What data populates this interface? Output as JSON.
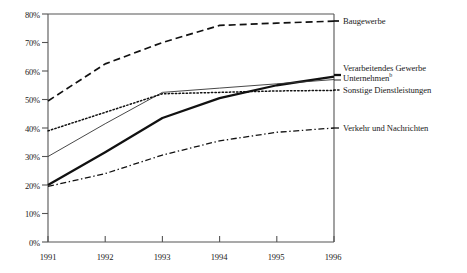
{
  "chart_data": {
    "type": "line",
    "title": "",
    "subtitle": "",
    "xlabel": "",
    "ylabel": "",
    "x": [
      "1991",
      "1992",
      "1993",
      "1994",
      "1995",
      "1996"
    ],
    "categories": [
      "1991",
      "1992",
      "1993",
      "1994",
      "1995",
      "1996"
    ],
    "xlim": [
      1991,
      1996
    ],
    "ylim": [
      0,
      80
    ],
    "ytick_labels": [
      "0%",
      "10%",
      "20%",
      "30%",
      "40%",
      "50%",
      "60%",
      "70%",
      "80%"
    ],
    "ytick_values": [
      0,
      10,
      20,
      30,
      40,
      50,
      60,
      70,
      80
    ],
    "xtick_labels": [
      "1991",
      "1992",
      "1993",
      "1994",
      "1995",
      "1996"
    ],
    "grid": false,
    "legend_position": "right-inline",
    "series": [
      {
        "name": "Baugewerbe",
        "style": "dashed",
        "values": [
          49.5,
          62.5,
          70.0,
          76.0,
          76.8,
          77.5
        ],
        "label_y_pct": 77.5
      },
      {
        "name": "Verarbeitendes Gewerbe Unternehmen",
        "style": "solid-thick",
        "values": [
          20.0,
          31.5,
          43.5,
          50.5,
          55.0,
          58.0
        ],
        "label_y_pct": 58.0
      },
      {
        "name": "Unternehmen",
        "style": "solid-thin",
        "values": [
          30.0,
          41.5,
          52.5,
          54.0,
          55.5,
          57.0
        ],
        "label_y_pct": 57.0
      },
      {
        "name": "Sonstige Dienstleistungen",
        "style": "dotted",
        "values": [
          39.0,
          45.5,
          52.0,
          52.5,
          53.0,
          53.2
        ],
        "label_y_pct": 53.2
      },
      {
        "name": "Verkehr und Nachrichten",
        "style": "dash-dot",
        "values": [
          19.5,
          24.0,
          30.5,
          35.5,
          38.5,
          40.0
        ],
        "label_y_pct": 40.0
      }
    ],
    "legend_entries": [
      {
        "label": "Baugewerbe",
        "style": "dashed"
      },
      {
        "label": "Verarbeitendes Gewerbe",
        "style": "solid-thick"
      },
      {
        "label": "Unternehmen",
        "footnote": "b",
        "style": "solid-thin"
      },
      {
        "label": "Sonstige Dienstleistungen",
        "style": "dotted"
      },
      {
        "label": "Verkehr und Nachrichten",
        "style": "dash-dot"
      }
    ],
    "colors": {
      "line": "#1a1a1a",
      "axis": "#555555",
      "background": "#ffffff"
    }
  },
  "labels": {
    "baugewerbe": "Baugewerbe",
    "verarbeitendes_gewerbe": "Verarbeitendes Gewerbe",
    "unternehmen": "Unternehmen",
    "unternehmen_footnote": "b",
    "sonstige_dienstleistungen": "Sonstige Dienstleistungen",
    "verkehr_und_nachrichten": "Verkehr und Nachrichten"
  },
  "yticks": {
    "t0": "0%",
    "t1": "10%",
    "t2": "20%",
    "t3": "30%",
    "t4": "40%",
    "t5": "50%",
    "t6": "60%",
    "t7": "70%",
    "t8": "80%"
  },
  "xticks": {
    "t0": "1991",
    "t1": "1992",
    "t2": "1993",
    "t3": "1994",
    "t4": "1995",
    "t5": "1996"
  }
}
